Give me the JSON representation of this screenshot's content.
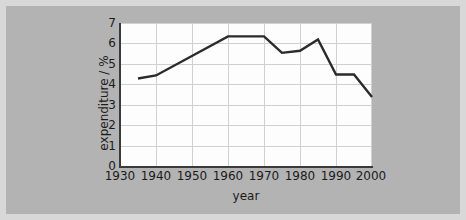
{
  "figure": {
    "background_color": "#b3b3b3",
    "frame_color": "#d8d8d8",
    "plot_background_color": "#fdfdfd",
    "gridline_color": "#d0d0d0",
    "axis_color": "#3a3a3a",
    "series_color": "#2b2b2b"
  },
  "chart_data": {
    "type": "line",
    "title": "",
    "xlabel": "year",
    "ylabel": "expenditure / %",
    "xlim": [
      1930,
      2000
    ],
    "ylim": [
      0,
      7
    ],
    "xticks": [
      1930,
      1940,
      1950,
      1960,
      1970,
      1980,
      1990,
      2000
    ],
    "yticks": [
      0,
      1,
      2,
      3,
      4,
      5,
      6,
      7
    ],
    "grid": true,
    "legend": "none",
    "x": [
      1935,
      1940,
      1960,
      1970,
      1975,
      1980,
      1985,
      1990,
      1995,
      2000
    ],
    "values": [
      4.3,
      4.45,
      6.35,
      6.35,
      5.55,
      5.65,
      6.2,
      4.5,
      4.5,
      3.4
    ],
    "series": [
      {
        "name": "expenditure",
        "x": [
          1935,
          1940,
          1960,
          1970,
          1975,
          1980,
          1985,
          1990,
          1995,
          2000
        ],
        "values": [
          4.3,
          4.45,
          6.35,
          6.35,
          5.55,
          5.65,
          6.2,
          4.5,
          4.5,
          3.4
        ]
      }
    ]
  },
  "axes": {
    "y_tick_labels": [
      "7",
      "6",
      "5",
      "4",
      "3",
      "2",
      "1",
      "0"
    ],
    "x_tick_labels": [
      "1930",
      "1940",
      "1950",
      "1960",
      "1970",
      "1980",
      "1990",
      "2000"
    ],
    "y_axis_title": "expenditure / %",
    "x_axis_title": "year"
  }
}
